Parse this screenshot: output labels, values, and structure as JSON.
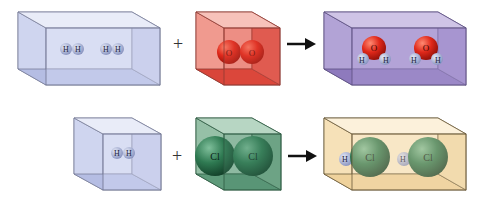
{
  "rows": [
    {
      "name": "water-formation",
      "reactant1": {
        "container": "rectangular-box",
        "color": "#c9d0ee",
        "molecules": [
          [
            "H",
            "H"
          ],
          [
            "H",
            "H"
          ]
        ]
      },
      "operator": "+",
      "reactant2": {
        "container": "cube",
        "color": "#e25a4e",
        "molecules": [
          [
            "O",
            "O"
          ]
        ]
      },
      "arrow": "→",
      "product": {
        "container": "rectangular-box",
        "color": "#9d88c8",
        "molecules": [
          [
            "H",
            "O",
            "H"
          ],
          [
            "H",
            "O",
            "H"
          ]
        ]
      }
    },
    {
      "name": "hydrogen-chloride-formation",
      "reactant1": {
        "container": "cube",
        "color": "#c9d0ee",
        "molecules": [
          [
            "H",
            "H"
          ]
        ]
      },
      "operator": "+",
      "reactant2": {
        "container": "cube",
        "color": "#4f8a6d",
        "molecules": [
          [
            "Cl",
            "Cl"
          ]
        ]
      },
      "arrow": "→",
      "product": {
        "container": "rectangular-box",
        "color": "#f3dcae",
        "molecules": [
          [
            "H",
            "Cl"
          ],
          [
            "H",
            "Cl"
          ]
        ]
      }
    }
  ],
  "labels": {
    "h": "H",
    "o": "O",
    "cl": "Cl",
    "plus": "+"
  }
}
